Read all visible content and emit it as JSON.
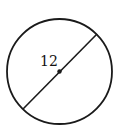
{
  "diagram": {
    "shape": "circle",
    "center": {
      "x": 59.5,
      "y": 71.5
    },
    "radius": 52.5,
    "stroke_color": "#1a1a1a",
    "diameter": {
      "x1": 97,
      "y1": 34,
      "x2": 23,
      "y2": 109,
      "label": "12"
    },
    "center_dot": true
  }
}
